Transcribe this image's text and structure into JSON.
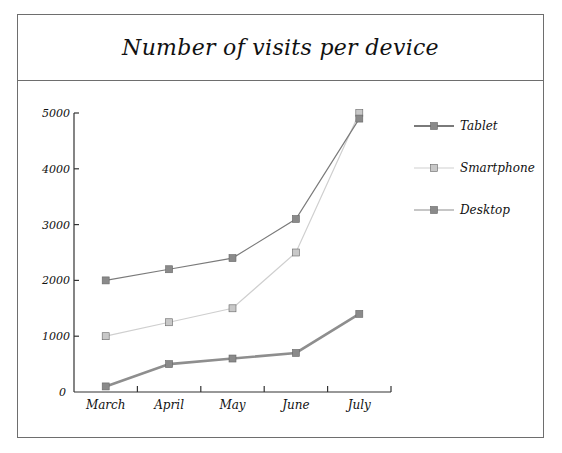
{
  "chart_data": {
    "type": "line",
    "title": "Number of visits per device",
    "xlabel": "",
    "ylabel": "",
    "categories": [
      "March",
      "April",
      "May",
      "June",
      "July"
    ],
    "yticks": [
      "0",
      "1000",
      "2000",
      "3000",
      "4000",
      "5000"
    ],
    "ylim": [
      0,
      5000
    ],
    "grid": false,
    "legend_position": "right",
    "series": [
      {
        "name": "Tablet",
        "values": [
          2000,
          2200,
          2400,
          3100,
          4900
        ],
        "color": "#7a7a7a",
        "marker": "#8a8a8a"
      },
      {
        "name": "Smartphone",
        "values": [
          1000,
          1250,
          1500,
          2500,
          5000
        ],
        "color": "#cfcfcf",
        "marker": "#c8c8c8"
      },
      {
        "name": "Desktop",
        "values": [
          100,
          500,
          600,
          700,
          1400
        ],
        "color": "#8e8e8e",
        "marker": "#8a8a8a"
      }
    ]
  }
}
